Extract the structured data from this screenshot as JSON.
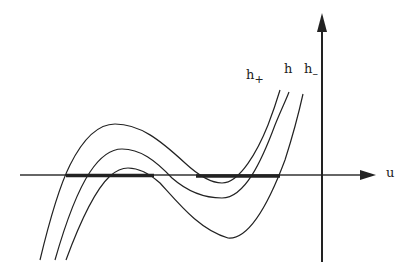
{
  "diagram": {
    "axis_x_label": "u",
    "curves": [
      {
        "name": "h+",
        "base": "h",
        "sub": "+"
      },
      {
        "name": "h",
        "base": "h",
        "sub": ""
      },
      {
        "name": "h-",
        "base": "h",
        "sub": "–"
      }
    ],
    "colors": {
      "ink": "#222222",
      "background": "#ffffff"
    }
  }
}
